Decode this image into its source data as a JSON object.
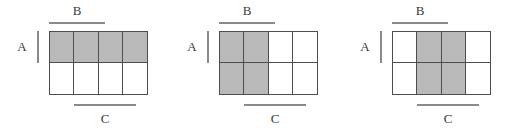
{
  "figure": {
    "type": "venn-grid-diagram",
    "panel_count": 3,
    "grid": {
      "rows": 2,
      "columns": 4
    },
    "colors": {
      "shaded_fill": "#b9b9b9",
      "unshaded_fill": "#ffffff",
      "grid_line": "#4d4d4d",
      "marker_line": "#8a8a8a",
      "label_text": "#3a3a3a"
    }
  },
  "panels": [
    {
      "name": "panel-a-highlighted",
      "labels": {
        "a": "A",
        "b": "B",
        "c": "C"
      },
      "highlighted_event": "A",
      "shaded_cells": [
        [
          true,
          true,
          true,
          true
        ],
        [
          false,
          false,
          false,
          false
        ]
      ]
    },
    {
      "name": "panel-b-highlighted",
      "labels": {
        "a": "A",
        "b": "B",
        "c": "C"
      },
      "highlighted_event": "B",
      "shaded_cells": [
        [
          true,
          true,
          false,
          false
        ],
        [
          true,
          true,
          false,
          false
        ]
      ]
    },
    {
      "name": "panel-c-highlighted",
      "labels": {
        "a": "A",
        "b": "B",
        "c": "C"
      },
      "highlighted_event": "C",
      "shaded_cells": [
        [
          false,
          true,
          true,
          false
        ],
        [
          false,
          true,
          true,
          false
        ]
      ]
    }
  ]
}
